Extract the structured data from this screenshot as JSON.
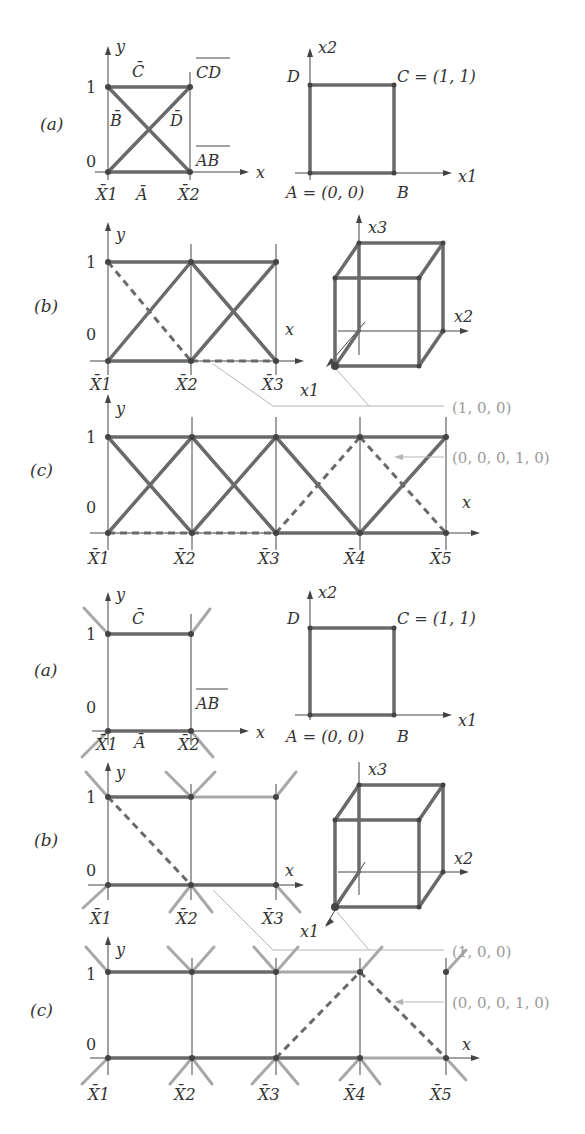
{
  "figure": {
    "top": {
      "panel_a": {
        "label": "(a)",
        "left": {
          "y_axis": "y",
          "x_axis": "x",
          "tick_1": "1",
          "tick_0": "0",
          "bottom_labels": [
            "X̄1",
            "Ā",
            "X̄2"
          ],
          "edge_labels": {
            "top": "C̄",
            "left_mid": "B̄",
            "right_mid": "D̄",
            "top_right": "CD",
            "bottom_right": "AB"
          }
        },
        "right": {
          "x_axis": "x1",
          "y_axis": "x2",
          "D": "D",
          "C": "C = (1, 1)",
          "A": "A = (0, 0)",
          "B": "B"
        }
      },
      "panel_b": {
        "label": "(b)",
        "y_axis": "y",
        "x_axis": "x",
        "tick_1": "1",
        "tick_0": "0",
        "bottom_labels": [
          "X̄1",
          "X̄2",
          "X̄3"
        ],
        "cube_axes": {
          "x1": "x1",
          "x2": "x2",
          "x3": "x3"
        }
      },
      "panel_c": {
        "label": "(c)",
        "y_axis": "y",
        "x_axis": "x",
        "tick_1": "1",
        "tick_0": "0",
        "bottom_labels": [
          "X̄1",
          "X̄2",
          "X̄3",
          "X̄4",
          "X̄5"
        ],
        "annotations": [
          "(1, 0, 0)",
          "(0, 0, 0, 1, 0)"
        ]
      }
    },
    "bottom": {
      "panel_a": {
        "label": "(a)",
        "left": {
          "y_axis": "y",
          "x_axis": "x",
          "tick_1": "1",
          "tick_0": "0",
          "bottom_labels": [
            "X̄1",
            "Ā",
            "X̄2"
          ],
          "edge_labels": {
            "top": "C̄",
            "bottom_right": "AB"
          }
        },
        "right": {
          "x_axis": "x1",
          "y_axis": "x2",
          "D": "D",
          "C": "C = (1, 1)",
          "A": "A = (0, 0)",
          "B": "B"
        }
      },
      "panel_b": {
        "label": "(b)",
        "y_axis": "y",
        "x_axis": "x",
        "tick_1": "1",
        "tick_0": "0",
        "bottom_labels": [
          "X̄1",
          "X̄2",
          "X̄3"
        ],
        "cube_axes": {
          "x1": "x1",
          "x2": "x2",
          "x3": "x3"
        }
      },
      "panel_c": {
        "label": "(c)",
        "y_axis": "y",
        "x_axis": "x",
        "tick_1": "1",
        "tick_0": "0",
        "bottom_labels": [
          "X̄1",
          "X̄2",
          "X̄3",
          "X̄4",
          "X̄5"
        ],
        "annotations": [
          "(1, 0, 0)",
          "(0, 0, 0, 1, 0)"
        ]
      }
    }
  }
}
